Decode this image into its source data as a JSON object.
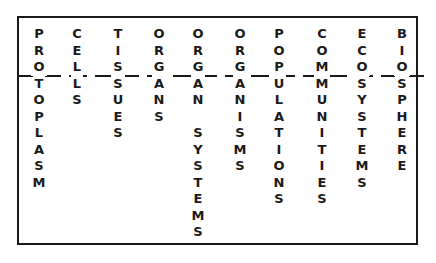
{
  "diagram": {
    "type": "hierarchy-levels-of-organization",
    "divider": "dashed-horizontal-line",
    "levels": [
      {
        "label": "PROTOPLASM",
        "letters": [
          "P",
          "R",
          "O",
          "T",
          "O",
          "P",
          "L",
          "A",
          "S",
          "M"
        ]
      },
      {
        "label": "CELLS",
        "letters": [
          "C",
          "E",
          "L",
          "L",
          "S"
        ]
      },
      {
        "label": "TISSUES",
        "letters": [
          "T",
          "I",
          "S",
          "S",
          "U",
          "E",
          "S"
        ]
      },
      {
        "label": "ORGANS",
        "letters": [
          "O",
          "R",
          "G",
          "A",
          "N",
          "S"
        ]
      },
      {
        "label": "ORGAN SYSTEMS",
        "letters": [
          "O",
          "R",
          "G",
          "A",
          "N",
          "",
          "S",
          "Y",
          "S",
          "T",
          "E",
          "M",
          "S"
        ]
      },
      {
        "label": "ORGANISMS",
        "letters": [
          "O",
          "R",
          "G",
          "A",
          "N",
          "I",
          "S",
          "M",
          "S"
        ]
      },
      {
        "label": "POPULATIONS",
        "letters": [
          "P",
          "O",
          "P",
          "U",
          "L",
          "A",
          "T",
          "I",
          "O",
          "N",
          "S"
        ]
      },
      {
        "label": "COMMUNITIES",
        "letters": [
          "C",
          "O",
          "M",
          "M",
          "U",
          "N",
          "I",
          "T",
          "I",
          "E",
          "S"
        ]
      },
      {
        "label": "ECOSYSTEMS",
        "letters": [
          "E",
          "C",
          "O",
          "S",
          "Y",
          "S",
          "T",
          "E",
          "M",
          "S"
        ]
      },
      {
        "label": "BIOSPHERE",
        "letters": [
          "B",
          "I",
          "O",
          "S",
          "P",
          "H",
          "E",
          "R",
          "E"
        ]
      }
    ]
  }
}
